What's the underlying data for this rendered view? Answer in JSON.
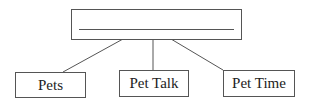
{
  "diagram": {
    "type": "tree",
    "root": {
      "label": "",
      "blank_line": true
    },
    "children": [
      {
        "label": "Pets"
      },
      {
        "label": "Pet Talk"
      },
      {
        "label": "Pet Time"
      }
    ],
    "colors": {
      "stroke": "#555555",
      "background": "#ffffff",
      "text": "#222222"
    }
  }
}
